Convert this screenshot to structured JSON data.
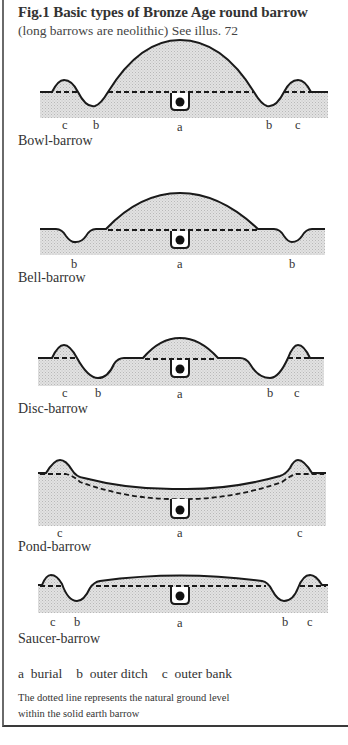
{
  "figure": {
    "title": "Fig.1  Basic types of Bronze Age round barrow",
    "subtitle": "(long barrows are neolithic) See illus. 72"
  },
  "diagrams": [
    {
      "name": "Bowl-barrow",
      "labels": [
        "c",
        "b",
        "a",
        "b",
        "c"
      ]
    },
    {
      "name": "Bell-barrow",
      "labels": [
        "b",
        "a",
        "b"
      ]
    },
    {
      "name": "Disc-barrow",
      "labels": [
        "c",
        "b",
        "a",
        "b",
        "c"
      ]
    },
    {
      "name": "Pond-barrow",
      "labels": [
        "c",
        "a",
        "c"
      ]
    },
    {
      "name": "Saucer-barrow",
      "labels": [
        "c",
        "b",
        "a",
        "b",
        "c"
      ]
    }
  ],
  "legend": {
    "a": "a  burial",
    "b": "b  outer ditch",
    "c": "c  outer bank"
  },
  "note": {
    "line1": "The dotted line represents the natural ground level",
    "line2": "within the solid earth barrow"
  },
  "colors": {
    "stroke": "#1a1a1a",
    "fill": "#dcdcdc",
    "frame": "#6a6a6a"
  }
}
